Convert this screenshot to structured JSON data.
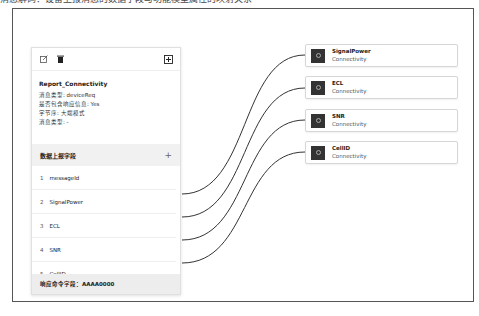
{
  "top_strip_text": "消息解码：设备上报消息的数据字段与功能模型属性的映射关系",
  "message_card": {
    "title": "Report_Connectivity",
    "meta": [
      {
        "label": "消息类型",
        "value": "deviceReq"
      },
      {
        "label": "是否包含响应信息",
        "value": "Yes"
      },
      {
        "label": "字节序",
        "value": "大端模式"
      },
      {
        "label": "消息类型",
        "value": "-"
      }
    ],
    "section_title": "数据上报字段",
    "fields": [
      {
        "index": "1",
        "name": "messageId"
      },
      {
        "index": "2",
        "name": "SignalPower"
      },
      {
        "index": "3",
        "name": "ECL"
      },
      {
        "index": "4",
        "name": "SNR"
      },
      {
        "index": "5",
        "name": "CellID"
      }
    ],
    "footer": "响应命令字段：AAAA0000"
  },
  "targets": [
    {
      "name": "SignalPower",
      "service": "Connectivity"
    },
    {
      "name": "ECL",
      "service": "Connectivity"
    },
    {
      "name": "SNR",
      "service": "Connectivity"
    },
    {
      "name": "CellID",
      "service": "Connectivity"
    }
  ],
  "link_color": "#333333"
}
